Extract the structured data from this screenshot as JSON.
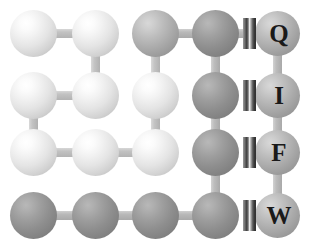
{
  "figure": {
    "canvas": {
      "width": 311,
      "height": 249,
      "background": "#ffffff"
    },
    "node_colors": {
      "light": "#f0f0f0",
      "mid": "#b4b4b4",
      "dark": "#8e8e8e"
    },
    "bond_color": "#c2c2c2",
    "marker_color": "#3b3b3b",
    "label_color": "#1a1a1a"
  },
  "grid": {
    "columns_x": [
      33,
      95,
      155,
      215,
      277
    ],
    "rows_y": [
      33,
      95,
      152,
      215
    ],
    "node_diameter": 47,
    "label_node_diameter": 45
  },
  "nodes": [
    {
      "id": "n-r1c1",
      "row": 1,
      "col": 1,
      "cx": 33,
      "cy": 33,
      "shade": "light",
      "label": ""
    },
    {
      "id": "n-r1c2",
      "row": 1,
      "col": 2,
      "cx": 95,
      "cy": 33,
      "shade": "light",
      "label": ""
    },
    {
      "id": "n-r1c3",
      "row": 1,
      "col": 3,
      "cx": 155,
      "cy": 33,
      "shade": "mid",
      "label": ""
    },
    {
      "id": "n-r1c4",
      "row": 1,
      "col": 4,
      "cx": 215,
      "cy": 33,
      "shade": "dark",
      "label": ""
    },
    {
      "id": "n-r1c5",
      "row": 1,
      "col": 5,
      "cx": 277,
      "cy": 33,
      "shade": "mid",
      "label": "Q"
    },
    {
      "id": "n-r2c1",
      "row": 2,
      "col": 1,
      "cx": 33,
      "cy": 95,
      "shade": "light",
      "label": ""
    },
    {
      "id": "n-r2c2",
      "row": 2,
      "col": 2,
      "cx": 95,
      "cy": 95,
      "shade": "light",
      "label": ""
    },
    {
      "id": "n-r2c3",
      "row": 2,
      "col": 3,
      "cx": 155,
      "cy": 95,
      "shade": "light",
      "label": ""
    },
    {
      "id": "n-r2c4",
      "row": 2,
      "col": 4,
      "cx": 215,
      "cy": 95,
      "shade": "dark",
      "label": ""
    },
    {
      "id": "n-r2c5",
      "row": 2,
      "col": 5,
      "cx": 277,
      "cy": 95,
      "shade": "mid",
      "label": "I"
    },
    {
      "id": "n-r3c1",
      "row": 3,
      "col": 1,
      "cx": 33,
      "cy": 152,
      "shade": "light",
      "label": ""
    },
    {
      "id": "n-r3c2",
      "row": 3,
      "col": 2,
      "cx": 95,
      "cy": 152,
      "shade": "light",
      "label": ""
    },
    {
      "id": "n-r3c3",
      "row": 3,
      "col": 3,
      "cx": 155,
      "cy": 152,
      "shade": "light",
      "label": ""
    },
    {
      "id": "n-r3c4",
      "row": 3,
      "col": 4,
      "cx": 215,
      "cy": 152,
      "shade": "dark",
      "label": ""
    },
    {
      "id": "n-r3c5",
      "row": 3,
      "col": 5,
      "cx": 277,
      "cy": 152,
      "shade": "mid",
      "label": "F"
    },
    {
      "id": "n-r4c1",
      "row": 4,
      "col": 1,
      "cx": 33,
      "cy": 215,
      "shade": "dark",
      "label": ""
    },
    {
      "id": "n-r4c2",
      "row": 4,
      "col": 2,
      "cx": 95,
      "cy": 215,
      "shade": "dark",
      "label": ""
    },
    {
      "id": "n-r4c3",
      "row": 4,
      "col": 3,
      "cx": 155,
      "cy": 215,
      "shade": "dark",
      "label": ""
    },
    {
      "id": "n-r4c4",
      "row": 4,
      "col": 4,
      "cx": 215,
      "cy": 215,
      "shade": "dark",
      "label": ""
    },
    {
      "id": "n-r4c5",
      "row": 4,
      "col": 5,
      "cx": 277,
      "cy": 215,
      "shade": "mid",
      "label": "W"
    }
  ],
  "bonds": [
    {
      "id": "b-r1c1-r1c2",
      "from": "n-r1c1",
      "to": "n-r1c2",
      "orientation": "horizontal",
      "tone": "light"
    },
    {
      "id": "b-r1c3-r1c4",
      "from": "n-r1c3",
      "to": "n-r1c4",
      "orientation": "horizontal",
      "tone": "dark"
    },
    {
      "id": "b-r1c4-r1c5",
      "from": "n-r1c4",
      "to": "n-r1c5",
      "orientation": "horizontal",
      "tone": "dark"
    },
    {
      "id": "b-r1c2-r2c2",
      "from": "n-r1c2",
      "to": "n-r2c2",
      "orientation": "vertical",
      "tone": "light"
    },
    {
      "id": "b-r1c3-r2c3",
      "from": "n-r1c3",
      "to": "n-r2c3",
      "orientation": "vertical",
      "tone": "light"
    },
    {
      "id": "b-r1c4-r2c4",
      "from": "n-r1c4",
      "to": "n-r2c4",
      "orientation": "vertical",
      "tone": "dark"
    },
    {
      "id": "b-r1c5-r2c5",
      "from": "n-r1c5",
      "to": "n-r2c5",
      "orientation": "vertical",
      "tone": "dark"
    },
    {
      "id": "b-r2c1-r2c2",
      "from": "n-r2c1",
      "to": "n-r2c2",
      "orientation": "horizontal",
      "tone": "light"
    },
    {
      "id": "b-r2c1-r3c1",
      "from": "n-r2c1",
      "to": "n-r3c1",
      "orientation": "vertical",
      "tone": "light"
    },
    {
      "id": "b-r2c3-r3c3",
      "from": "n-r2c3",
      "to": "n-r3c3",
      "orientation": "vertical",
      "tone": "light"
    },
    {
      "id": "b-r2c4-r3c4",
      "from": "n-r2c4",
      "to": "n-r3c4",
      "orientation": "vertical",
      "tone": "dark"
    },
    {
      "id": "b-r2c5-r3c5",
      "from": "n-r2c5",
      "to": "n-r3c5",
      "orientation": "vertical",
      "tone": "dark"
    },
    {
      "id": "b-r3c1-r3c2",
      "from": "n-r3c1",
      "to": "n-r3c2",
      "orientation": "horizontal",
      "tone": "light"
    },
    {
      "id": "b-r3c2-r3c3",
      "from": "n-r3c2",
      "to": "n-r3c3",
      "orientation": "horizontal",
      "tone": "light"
    },
    {
      "id": "b-r3c4-r4c4",
      "from": "n-r3c4",
      "to": "n-r4c4",
      "orientation": "vertical",
      "tone": "dark"
    },
    {
      "id": "b-r3c5-r4c5",
      "from": "n-r3c5",
      "to": "n-r4c5",
      "orientation": "vertical",
      "tone": "dark"
    },
    {
      "id": "b-r4c1-r4c2",
      "from": "n-r4c1",
      "to": "n-r4c2",
      "orientation": "horizontal",
      "tone": "dark"
    },
    {
      "id": "b-r4c2-r4c3",
      "from": "n-r4c2",
      "to": "n-r4c3",
      "orientation": "horizontal",
      "tone": "dark"
    },
    {
      "id": "b-r4c3-r4c4",
      "from": "n-r4c3",
      "to": "n-r4c4",
      "orientation": "horizontal",
      "tone": "dark"
    }
  ],
  "markers": [
    {
      "id": "m-q",
      "for_node": "n-r1c5",
      "cx": 249,
      "cy": 33,
      "width": 13,
      "height": 31
    },
    {
      "id": "m-i",
      "for_node": "n-r2c5",
      "cx": 249,
      "cy": 95,
      "width": 13,
      "height": 31
    },
    {
      "id": "m-f",
      "for_node": "n-r3c5",
      "cx": 249,
      "cy": 152,
      "width": 13,
      "height": 31
    },
    {
      "id": "m-w",
      "for_node": "n-r4c5",
      "cx": 249,
      "cy": 215,
      "width": 13,
      "height": 31
    }
  ],
  "labels": {
    "q": "Q",
    "i": "I",
    "f": "F",
    "w": "W"
  }
}
